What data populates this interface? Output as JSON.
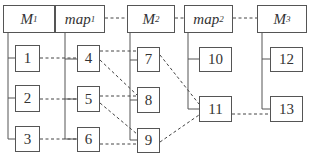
{
  "diagram": {
    "top_nodes": [
      {
        "id": "M1",
        "label": "M",
        "sub": "1"
      },
      {
        "id": "map1",
        "label": "map",
        "sub": "1"
      },
      {
        "id": "M2",
        "label": "M",
        "sub": "2"
      },
      {
        "id": "map2",
        "label": "map",
        "sub": "2"
      },
      {
        "id": "M3",
        "label": "M",
        "sub": "3"
      }
    ],
    "nodes": {
      "n1": "1",
      "n2": "2",
      "n3": "3",
      "n4": "4",
      "n5": "5",
      "n6": "6",
      "n7": "7",
      "n8": "8",
      "n9": "9",
      "n10": "10",
      "n11": "11",
      "n12": "12",
      "n13": "13"
    },
    "tree_edges": [
      [
        "M1",
        "1"
      ],
      [
        "M1",
        "2"
      ],
      [
        "M1",
        "3"
      ],
      [
        "map1",
        "4"
      ],
      [
        "map1",
        "5"
      ],
      [
        "map1",
        "6"
      ],
      [
        "M2",
        "7"
      ],
      [
        "M2",
        "8"
      ],
      [
        "M2",
        "9"
      ],
      [
        "map2",
        "10"
      ],
      [
        "map2",
        "11"
      ],
      [
        "M3",
        "12"
      ],
      [
        "M3",
        "13"
      ]
    ],
    "dashed_edges": [
      [
        "M1",
        "map1"
      ],
      [
        "map1",
        "M2"
      ],
      [
        "M2",
        "map2"
      ],
      [
        "map2",
        "M3"
      ],
      [
        "1",
        "4"
      ],
      [
        "2",
        "5"
      ],
      [
        "3",
        "6"
      ],
      [
        "4",
        "7"
      ],
      [
        "4",
        "8"
      ],
      [
        "5",
        "8"
      ],
      [
        "5",
        "9"
      ],
      [
        "6",
        "9"
      ],
      [
        "7",
        "11"
      ],
      [
        "9",
        "11"
      ],
      [
        "11",
        "13"
      ]
    ]
  }
}
